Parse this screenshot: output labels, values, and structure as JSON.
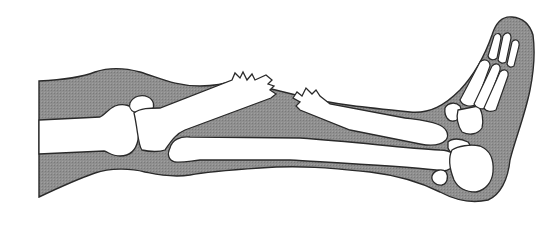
{
  "diagram": {
    "colors": {
      "background": "#ffffff",
      "soft_tissue": "#8c8c8c",
      "bone": "#ffffff",
      "outline": "#2a2a2a"
    },
    "parts": [
      {
        "id": "thigh-soft-tissue",
        "label": "Thigh soft tissue"
      },
      {
        "id": "femur",
        "label": "Femur (distal end)"
      },
      {
        "id": "patella",
        "label": "Patella"
      },
      {
        "id": "tibia-proximal",
        "label": "Tibia (proximal fragment)"
      },
      {
        "id": "fracture-site",
        "label": "Fracture"
      },
      {
        "id": "tibia-distal",
        "label": "Tibia (distal fragment)"
      },
      {
        "id": "fibula",
        "label": "Fibula"
      },
      {
        "id": "ankle-tarsals",
        "label": "Tarsal bones"
      },
      {
        "id": "calcaneus",
        "label": "Calcaneus"
      },
      {
        "id": "metatarsals",
        "label": "Metatarsals"
      },
      {
        "id": "toes",
        "label": "Phalanges"
      }
    ]
  }
}
